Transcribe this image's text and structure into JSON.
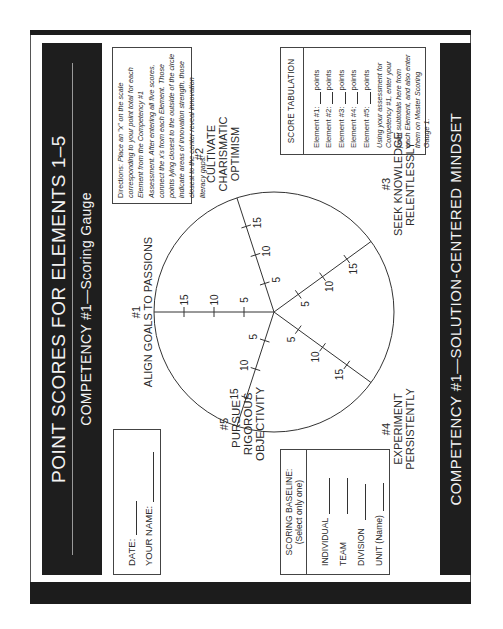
{
  "header": {
    "title": "POINT SCORES FOR ELEMENTS 1–5",
    "subtitle": "COMPETENCY #1—Scoring Gauge"
  },
  "footer": {
    "title": "COMPETENCY #1—SOLUTION-CENTERED MINDSET"
  },
  "form": {
    "date_label": "DATE:",
    "name_label": "YOUR NAME:"
  },
  "directions": {
    "lead": "Directions:",
    "text": "Place an \"x\" on the scale corresponding to your point total for each Element from the Competency #1 Assessment. After entering all five scores, connect the x's from each Element. Those points lying closest to the outside of the circle indicate areas of innovation strength, those closest to the center reveal innovation literacy gaps."
  },
  "score_tabulation": {
    "title": "SCORE TABULATION",
    "rows": [
      {
        "label": "Element #1:",
        "suffix": "points"
      },
      {
        "label": "Element #2:",
        "suffix": "points"
      },
      {
        "label": "Element #3:",
        "suffix": "points"
      },
      {
        "label": "Element #4:",
        "suffix": "points"
      },
      {
        "label": "Element #5:",
        "suffix": "points"
      }
    ],
    "note": "Using your assessment for Competency #1, enter your point subtotals here from each Element, and also enter them on Master Scoring Gauge 1."
  },
  "scoring_baseline": {
    "title": "SCORING BASELINE:",
    "subtitle": "(Select only one)",
    "options": [
      "INDIVIDUAL",
      "TEAM",
      "DIVISION",
      "UNIT (Name)"
    ]
  },
  "gauge": {
    "elements": [
      {
        "number": "#1",
        "lines": [
          "ALIGN GOALS TO PASSIONS"
        ]
      },
      {
        "number": "#2",
        "lines": [
          "CULTIVATE",
          "CHARISMATIC",
          "OPTIMISM"
        ]
      },
      {
        "number": "#3",
        "lines": [
          "SEEK KNOWLEDGE",
          "RELENTLESSLY"
        ]
      },
      {
        "number": "#4",
        "lines": [
          "EXPERIMENT",
          "PERSISTENTLY"
        ]
      },
      {
        "number": "#5",
        "lines": [
          "PURSUE",
          "RIGOROUS",
          "OBJECTIVITY"
        ]
      }
    ],
    "ticks": [
      "5",
      "10",
      "15"
    ]
  }
}
